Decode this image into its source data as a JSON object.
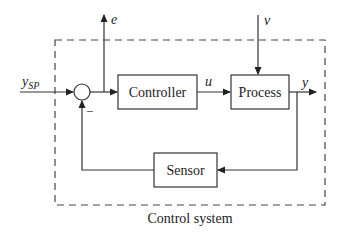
{
  "diagram": {
    "type": "feedback-control-block-diagram",
    "boundary_label": "Control system",
    "blocks": [
      {
        "id": "controller",
        "label": "Controller"
      },
      {
        "id": "process",
        "label": "Process"
      },
      {
        "id": "sensor",
        "label": "Sensor"
      }
    ],
    "summing_junction": {
      "feedback_sign": "−"
    },
    "signals": {
      "setpoint": {
        "symbol": "y",
        "subscript": "SP"
      },
      "error": "e",
      "control": "u",
      "disturbance": "v",
      "output": "y"
    },
    "colors": {
      "line": "#333333",
      "background": "#ffffff"
    }
  }
}
